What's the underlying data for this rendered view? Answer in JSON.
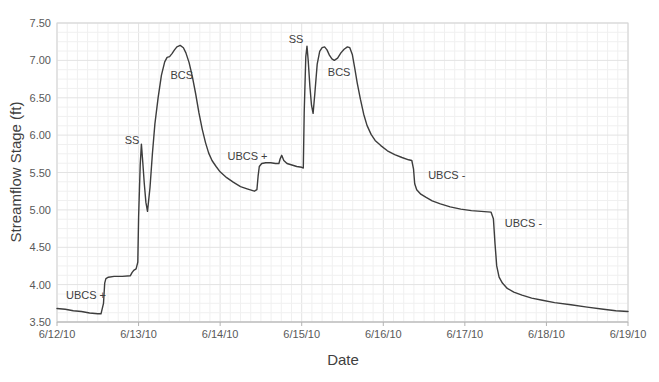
{
  "chart_data": {
    "type": "line",
    "title": "",
    "xlabel": "Date",
    "ylabel": "Streamflow Stage (ft)",
    "legend": "none",
    "grid": "fine minor grid on, light gray",
    "xlim_days": [
      0,
      7
    ],
    "ylim": [
      3.5,
      7.5
    ],
    "x_ticks": [
      {
        "day": 0,
        "label": "6/12/10"
      },
      {
        "day": 1,
        "label": "6/13/10"
      },
      {
        "day": 2,
        "label": "6/14/10"
      },
      {
        "day": 3,
        "label": "6/15/10"
      },
      {
        "day": 4,
        "label": "6/16/10"
      },
      {
        "day": 5,
        "label": "6/17/10"
      },
      {
        "day": 6,
        "label": "6/18/10"
      },
      {
        "day": 7,
        "label": "6/19/10"
      }
    ],
    "y_ticks": [
      {
        "value": 3.5,
        "label": "3.50"
      },
      {
        "value": 4.0,
        "label": "4.00"
      },
      {
        "value": 4.5,
        "label": "4.50"
      },
      {
        "value": 5.0,
        "label": "5.00"
      },
      {
        "value": 5.5,
        "label": "5.50"
      },
      {
        "value": 6.0,
        "label": "6.00"
      },
      {
        "value": 6.5,
        "label": "6.50"
      },
      {
        "value": 7.0,
        "label": "7.00"
      },
      {
        "value": 7.5,
        "label": "7.50"
      }
    ],
    "annotations": [
      {
        "label": "UBCS +",
        "day": 0.11,
        "stage": 3.86
      },
      {
        "label": "SS",
        "day": 0.83,
        "stage": 5.93
      },
      {
        "label": "BCS",
        "day": 1.39,
        "stage": 6.8
      },
      {
        "label": "UBCS +",
        "day": 2.09,
        "stage": 5.72
      },
      {
        "label": "SS",
        "day": 2.84,
        "stage": 7.28
      },
      {
        "label": "BCS",
        "day": 3.32,
        "stage": 6.85
      },
      {
        "label": "UBCS -",
        "day": 4.55,
        "stage": 5.46
      },
      {
        "label": "UBCS -",
        "day": 5.49,
        "stage": 4.83
      }
    ],
    "series": [
      {
        "name": "Streamflow Stage",
        "points_day_stage": [
          [
            0.0,
            3.68
          ],
          [
            0.1,
            3.67
          ],
          [
            0.2,
            3.65
          ],
          [
            0.3,
            3.64
          ],
          [
            0.4,
            3.62
          ],
          [
            0.5,
            3.61
          ],
          [
            0.54,
            3.61
          ],
          [
            0.57,
            3.75
          ],
          [
            0.585,
            4.02
          ],
          [
            0.6,
            4.08
          ],
          [
            0.63,
            4.1
          ],
          [
            0.7,
            4.11
          ],
          [
            0.8,
            4.11
          ],
          [
            0.9,
            4.12
          ],
          [
            0.92,
            4.16
          ],
          [
            0.94,
            4.19
          ],
          [
            0.97,
            4.21
          ],
          [
            0.99,
            4.3
          ],
          [
            1.0,
            4.9
          ],
          [
            1.02,
            5.6
          ],
          [
            1.035,
            5.88
          ],
          [
            1.05,
            5.65
          ],
          [
            1.07,
            5.35
          ],
          [
            1.09,
            5.1
          ],
          [
            1.11,
            4.98
          ],
          [
            1.14,
            5.3
          ],
          [
            1.17,
            5.75
          ],
          [
            1.2,
            6.15
          ],
          [
            1.24,
            6.5
          ],
          [
            1.28,
            6.8
          ],
          [
            1.32,
            6.98
          ],
          [
            1.35,
            7.04
          ],
          [
            1.38,
            7.05
          ],
          [
            1.41,
            7.09
          ],
          [
            1.44,
            7.14
          ],
          [
            1.47,
            7.18
          ],
          [
            1.51,
            7.2
          ],
          [
            1.55,
            7.17
          ],
          [
            1.58,
            7.1
          ],
          [
            1.62,
            6.97
          ],
          [
            1.66,
            6.78
          ],
          [
            1.7,
            6.55
          ],
          [
            1.74,
            6.3
          ],
          [
            1.78,
            6.08
          ],
          [
            1.82,
            5.9
          ],
          [
            1.86,
            5.76
          ],
          [
            1.9,
            5.66
          ],
          [
            1.95,
            5.58
          ],
          [
            2.0,
            5.51
          ],
          [
            2.08,
            5.43
          ],
          [
            2.16,
            5.37
          ],
          [
            2.25,
            5.31
          ],
          [
            2.33,
            5.28
          ],
          [
            2.42,
            5.25
          ],
          [
            2.45,
            5.27
          ],
          [
            2.465,
            5.45
          ],
          [
            2.48,
            5.58
          ],
          [
            2.51,
            5.62
          ],
          [
            2.56,
            5.63
          ],
          [
            2.62,
            5.63
          ],
          [
            2.68,
            5.62
          ],
          [
            2.72,
            5.62
          ],
          [
            2.735,
            5.68
          ],
          [
            2.755,
            5.73
          ],
          [
            2.78,
            5.66
          ],
          [
            2.82,
            5.62
          ],
          [
            2.88,
            5.6
          ],
          [
            2.94,
            5.58
          ],
          [
            3.0,
            5.57
          ],
          [
            3.02,
            5.56
          ],
          [
            3.03,
            6.3
          ],
          [
            3.05,
            7.05
          ],
          [
            3.065,
            7.19
          ],
          [
            3.08,
            7.0
          ],
          [
            3.1,
            6.65
          ],
          [
            3.12,
            6.4
          ],
          [
            3.14,
            6.29
          ],
          [
            3.16,
            6.55
          ],
          [
            3.19,
            6.95
          ],
          [
            3.22,
            7.12
          ],
          [
            3.25,
            7.17
          ],
          [
            3.28,
            7.18
          ],
          [
            3.31,
            7.14
          ],
          [
            3.34,
            7.07
          ],
          [
            3.37,
            7.02
          ],
          [
            3.4,
            7.0
          ],
          [
            3.44,
            7.03
          ],
          [
            3.48,
            7.1
          ],
          [
            3.52,
            7.15
          ],
          [
            3.56,
            7.18
          ],
          [
            3.59,
            7.17
          ],
          [
            3.62,
            7.08
          ],
          [
            3.65,
            6.9
          ],
          [
            3.68,
            6.7
          ],
          [
            3.72,
            6.48
          ],
          [
            3.76,
            6.28
          ],
          [
            3.8,
            6.13
          ],
          [
            3.85,
            6.01
          ],
          [
            3.9,
            5.93
          ],
          [
            3.97,
            5.86
          ],
          [
            4.05,
            5.79
          ],
          [
            4.14,
            5.74
          ],
          [
            4.23,
            5.7
          ],
          [
            4.31,
            5.67
          ],
          [
            4.35,
            5.66
          ],
          [
            4.37,
            5.55
          ],
          [
            4.385,
            5.35
          ],
          [
            4.41,
            5.27
          ],
          [
            4.46,
            5.21
          ],
          [
            4.52,
            5.17
          ],
          [
            4.6,
            5.12
          ],
          [
            4.7,
            5.08
          ],
          [
            4.82,
            5.04
          ],
          [
            4.95,
            5.01
          ],
          [
            5.08,
            4.99
          ],
          [
            5.2,
            4.98
          ],
          [
            5.32,
            4.97
          ],
          [
            5.35,
            4.88
          ],
          [
            5.37,
            4.55
          ],
          [
            5.39,
            4.25
          ],
          [
            5.42,
            4.1
          ],
          [
            5.46,
            4.02
          ],
          [
            5.52,
            3.95
          ],
          [
            5.6,
            3.9
          ],
          [
            5.7,
            3.86
          ],
          [
            5.82,
            3.82
          ],
          [
            5.95,
            3.79
          ],
          [
            6.1,
            3.76
          ],
          [
            6.3,
            3.73
          ],
          [
            6.5,
            3.7
          ],
          [
            6.7,
            3.67
          ],
          [
            6.85,
            3.65
          ],
          [
            7.0,
            3.64
          ]
        ]
      }
    ],
    "colors": {
      "line": "#3d3d3d",
      "minor_grid": "#f0f0f0",
      "major_grid": "#e3e3e3",
      "plot_border": "#d6d6d6",
      "axis_line": "#b3b3b3",
      "tick_label": "#595959",
      "axis_title": "#3f3f3f",
      "annotation_text": "#404040",
      "background": "#ffffff"
    }
  }
}
